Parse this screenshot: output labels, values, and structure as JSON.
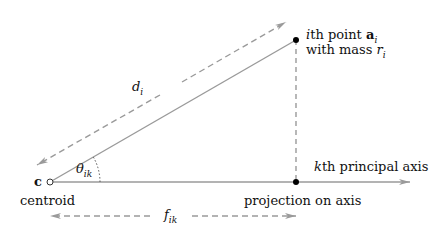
{
  "diagram": {
    "colors": {
      "line": "#9a9a9a",
      "point": "#000000",
      "text": "#111111"
    },
    "labels": {
      "centroid_symbol": "c",
      "centroid": "centroid",
      "angle_sym": "θ",
      "angle_sub": "ik",
      "distance_sym": "d",
      "distance_sub": "i",
      "point_line1_pre": "i",
      "point_line1_mid": "th point ",
      "point_line1_bold": "a",
      "point_line1_sub": "i",
      "point_line2_pre": "with mass ",
      "point_line2_sym": "r",
      "point_line2_sub": "i",
      "axis_pre": "k",
      "axis_rest": "th principal axis",
      "projection": "projection on axis",
      "proj_len_sym": "f",
      "proj_len_sub": "ik"
    },
    "points": {
      "centroid": [
        50,
        182
      ],
      "point_i": [
        296,
        40
      ],
      "projection": [
        296,
        182
      ],
      "axis_end": [
        410,
        182
      ]
    }
  }
}
